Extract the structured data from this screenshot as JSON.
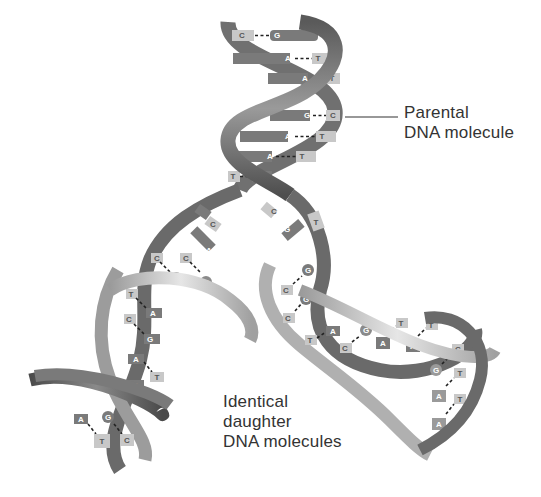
{
  "diagram": {
    "labels": {
      "parental": [
        "Parental",
        "DNA molecule"
      ],
      "daughter": [
        "Identical",
        "daughter",
        "DNA molecules"
      ]
    },
    "colors": {
      "background": "#ffffff",
      "old_strand": "#6b6b6b",
      "new_strand": "#b4b4b4",
      "old_base": "#7a7a7a",
      "new_base": "#c8c8c8",
      "text": "#333333",
      "leader_line": "#333333"
    },
    "parental_helix": {
      "base_pairs": [
        {
          "left": "C",
          "right": "G"
        },
        {
          "left": "A",
          "right": "T"
        },
        {
          "left": "A",
          "right": "T"
        },
        {
          "left": "G",
          "right": "C"
        },
        {
          "left": "A",
          "right": "T"
        },
        {
          "left": "A",
          "right": "T"
        },
        {
          "left": "T",
          "right": "A"
        }
      ]
    },
    "replication_fork": {
      "left_unpaired": [
        "G",
        "C",
        "A"
      ],
      "right_unpaired": [
        "C",
        "G",
        "T"
      ]
    },
    "left_daughter": {
      "base_pairs": [
        {
          "left": "C",
          "right": "G"
        },
        {
          "left": "C",
          "right": "G"
        },
        {
          "left": "T",
          "right": "A"
        },
        {
          "left": "C",
          "right": "G"
        },
        {
          "left": "A",
          "right": "T"
        },
        {
          "left": "A",
          "right": "T"
        },
        {
          "left": "A",
          "right": "T"
        },
        {
          "left": "G",
          "right": "C"
        }
      ]
    },
    "right_daughter": {
      "base_pairs": [
        {
          "left": "C",
          "right": "G"
        },
        {
          "left": "C",
          "right": "G"
        },
        {
          "left": "T",
          "right": "A"
        },
        {
          "left": "C",
          "right": "G"
        },
        {
          "left": "A",
          "right": "T"
        },
        {
          "left": "A",
          "right": "T"
        },
        {
          "left": "G",
          "right": "C"
        },
        {
          "left": "A",
          "right": "T"
        },
        {
          "left": "A",
          "right": "T"
        }
      ]
    }
  }
}
